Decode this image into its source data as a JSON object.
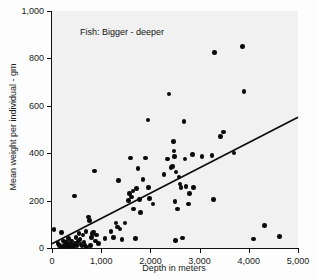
{
  "chart_data": {
    "type": "scatter",
    "title": "Fish: Bigger - deeper",
    "xlabel": "Depth in meters",
    "ylabel": "Mean weight per individual - gm",
    "xlim": [
      0,
      5000
    ],
    "ylim": [
      0,
      1000
    ],
    "xticks": [
      0,
      1000,
      2000,
      3000,
      4000,
      5000
    ],
    "yticks": [
      0,
      200,
      400,
      600,
      800,
      1000
    ],
    "xtick_labels": [
      "0",
      "1,000",
      "2,000",
      "3,000",
      "4,000",
      "5,000"
    ],
    "ytick_labels": [
      "0",
      "200",
      "400",
      "600",
      "800",
      "1,000"
    ],
    "grid": false,
    "legend": "none",
    "point_color": "#0a0a0a",
    "line_color": "#0a0a0a",
    "plot_background": "#f1f1f1",
    "trendline": {
      "label": "linear fit",
      "x0": 0,
      "y0": 18,
      "x1": 5000,
      "y1": 552
    },
    "points": [
      {
        "x": 40,
        "y": 78
      },
      {
        "x": 120,
        "y": 20
      },
      {
        "x": 150,
        "y": 10
      },
      {
        "x": 190,
        "y": 65
      },
      {
        "x": 210,
        "y": 5
      },
      {
        "x": 230,
        "y": 30
      },
      {
        "x": 250,
        "y": 12
      },
      {
        "x": 270,
        "y": 8
      },
      {
        "x": 300,
        "y": 22
      },
      {
        "x": 320,
        "y": 5
      },
      {
        "x": 340,
        "y": 40
      },
      {
        "x": 360,
        "y": 15
      },
      {
        "x": 380,
        "y": 8
      },
      {
        "x": 400,
        "y": 30
      },
      {
        "x": 420,
        "y": 12
      },
      {
        "x": 440,
        "y": 5
      },
      {
        "x": 455,
        "y": 220
      },
      {
        "x": 470,
        "y": 20
      },
      {
        "x": 490,
        "y": 45
      },
      {
        "x": 510,
        "y": 10
      },
      {
        "x": 530,
        "y": 28
      },
      {
        "x": 550,
        "y": 60
      },
      {
        "x": 570,
        "y": 35
      },
      {
        "x": 590,
        "y": 15
      },
      {
        "x": 610,
        "y": 8
      },
      {
        "x": 630,
        "y": 55
      },
      {
        "x": 650,
        "y": 25
      },
      {
        "x": 670,
        "y": 10
      },
      {
        "x": 690,
        "y": 70
      },
      {
        "x": 700,
        "y": 5
      },
      {
        "x": 740,
        "y": 130
      },
      {
        "x": 760,
        "y": 115
      },
      {
        "x": 780,
        "y": 10
      },
      {
        "x": 800,
        "y": 45
      },
      {
        "x": 820,
        "y": 60
      },
      {
        "x": 840,
        "y": 68
      },
      {
        "x": 860,
        "y": 325
      },
      {
        "x": 880,
        "y": 30
      },
      {
        "x": 900,
        "y": 55
      },
      {
        "x": 950,
        "y": 20
      },
      {
        "x": 1080,
        "y": 40
      },
      {
        "x": 1200,
        "y": 70
      },
      {
        "x": 1250,
        "y": 45
      },
      {
        "x": 1300,
        "y": 105
      },
      {
        "x": 1330,
        "y": 88
      },
      {
        "x": 1350,
        "y": 285
      },
      {
        "x": 1380,
        "y": 80
      },
      {
        "x": 1420,
        "y": 35
      },
      {
        "x": 1480,
        "y": 105
      },
      {
        "x": 1550,
        "y": 200
      },
      {
        "x": 1580,
        "y": 230
      },
      {
        "x": 1600,
        "y": 380
      },
      {
        "x": 1620,
        "y": 215
      },
      {
        "x": 1650,
        "y": 240
      },
      {
        "x": 1660,
        "y": 165
      },
      {
        "x": 1700,
        "y": 40
      },
      {
        "x": 1720,
        "y": 250
      },
      {
        "x": 1750,
        "y": 335
      },
      {
        "x": 1780,
        "y": 205
      },
      {
        "x": 1800,
        "y": 150
      },
      {
        "x": 1850,
        "y": 290
      },
      {
        "x": 1900,
        "y": 380
      },
      {
        "x": 1950,
        "y": 540
      },
      {
        "x": 1960,
        "y": 255
      },
      {
        "x": 1980,
        "y": 210
      },
      {
        "x": 2050,
        "y": 185
      },
      {
        "x": 2280,
        "y": 310
      },
      {
        "x": 2350,
        "y": 375
      },
      {
        "x": 2380,
        "y": 650
      },
      {
        "x": 2420,
        "y": 340
      },
      {
        "x": 2450,
        "y": 345
      },
      {
        "x": 2470,
        "y": 450
      },
      {
        "x": 2480,
        "y": 410
      },
      {
        "x": 2490,
        "y": 385
      },
      {
        "x": 2500,
        "y": 195
      },
      {
        "x": 2510,
        "y": 32
      },
      {
        "x": 2520,
        "y": 320
      },
      {
        "x": 2550,
        "y": 165
      },
      {
        "x": 2580,
        "y": 300
      },
      {
        "x": 2600,
        "y": 270
      },
      {
        "x": 2620,
        "y": 255
      },
      {
        "x": 2650,
        "y": 42
      },
      {
        "x": 2680,
        "y": 535
      },
      {
        "x": 2700,
        "y": 375
      },
      {
        "x": 2720,
        "y": 260
      },
      {
        "x": 2780,
        "y": 185
      },
      {
        "x": 2800,
        "y": 230
      },
      {
        "x": 2850,
        "y": 395
      },
      {
        "x": 2880,
        "y": 255
      },
      {
        "x": 3050,
        "y": 385
      },
      {
        "x": 3250,
        "y": 390
      },
      {
        "x": 3280,
        "y": 205
      },
      {
        "x": 3300,
        "y": 825
      },
      {
        "x": 3420,
        "y": 470
      },
      {
        "x": 3480,
        "y": 490
      },
      {
        "x": 3700,
        "y": 400
      },
      {
        "x": 3870,
        "y": 850
      },
      {
        "x": 3900,
        "y": 660
      },
      {
        "x": 4100,
        "y": 38
      },
      {
        "x": 4320,
        "y": 95
      },
      {
        "x": 4620,
        "y": 48
      }
    ]
  }
}
